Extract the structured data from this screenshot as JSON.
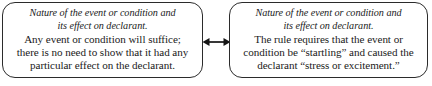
{
  "diagram": {
    "type": "two-node-comparison",
    "background_color": "#ffffff",
    "stroke_color": "#2b2b2b",
    "text_color": "#1a1a1a",
    "nodes": [
      {
        "id": "left",
        "heading": "Nature of the event or condition and\nits effect on declarant.",
        "body": "Any event or condition will suffice;\nthere is no need to show that it had any\nparticular effect on the declarant."
      },
      {
        "id": "right",
        "heading": "Nature of the event or condition and\nits effect on declarant.",
        "body": "The rule requires that the event or\ncondition be “startling” and caused the\ndeclarant “stress or excitement.”"
      }
    ],
    "connector": {
      "icon": "double-headed-arrow-icon",
      "direction": "bidirectional"
    }
  }
}
